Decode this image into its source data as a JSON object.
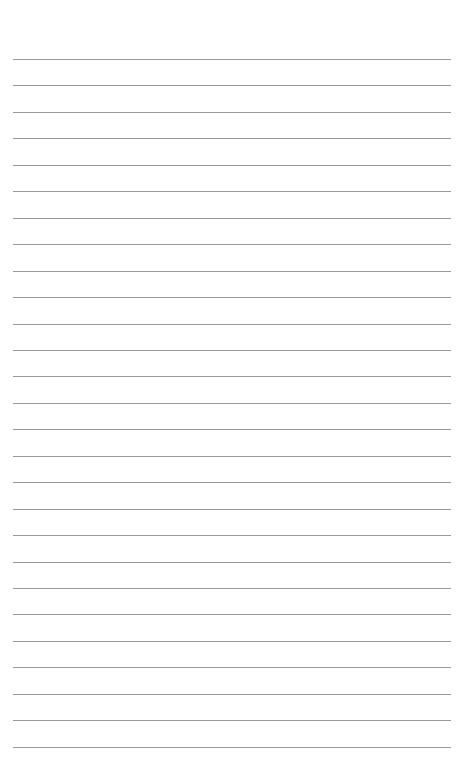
{
  "page": {
    "type": "lined-paper",
    "background": "#ffffff",
    "line_color": "#9a9a9a",
    "line_count": 27,
    "first_line_y": 59,
    "line_spacing": 26.45,
    "line_left": 13,
    "line_width": 438
  }
}
